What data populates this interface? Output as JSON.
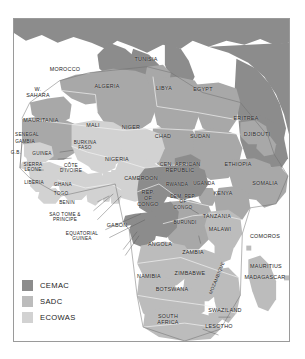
{
  "figure": {
    "type": "thematic-map",
    "region": "Africa",
    "title": "",
    "background_color": "#ffffff",
    "frame_color": "#9a9a9a"
  },
  "legend": {
    "position": "bottom-left",
    "items": [
      {
        "label": "CEMAC",
        "color": "#8c8c8c",
        "name": "cemac"
      },
      {
        "label": "SADC",
        "color": "#bcbcbc",
        "name": "sadc"
      },
      {
        "label": "ECOWAS",
        "color": "#d2d2d2",
        "name": "ecowas"
      }
    ]
  },
  "palette": {
    "cemac": "#8c8c8c",
    "sadc": "#bcbcbc",
    "ecowas": "#d2d2d2",
    "other_africa": "#a8a8a8",
    "outside": "#8c8c8c",
    "water": "#ffffff",
    "border_line": "#f2f2f2",
    "coast_line": "#6e6e6e",
    "leader_line": "#5a5a5a",
    "text": "#1b1b1b"
  },
  "map_labels": [
    {
      "text": "MOROCCO",
      "x": 64,
      "y": 68,
      "size": "n",
      "group": "other"
    },
    {
      "text": "W.\nSAHARA",
      "x": 37,
      "y": 91,
      "size": "n",
      "group": "other"
    },
    {
      "text": "ALGERIA",
      "x": 106,
      "y": 85,
      "size": "n",
      "group": "other"
    },
    {
      "text": "TUNISIA",
      "x": 145,
      "y": 58,
      "size": "n",
      "group": "other"
    },
    {
      "text": "LIBYA",
      "x": 163,
      "y": 87,
      "size": "n",
      "group": "other"
    },
    {
      "text": "EGYPT",
      "x": 202,
      "y": 88,
      "size": "n",
      "group": "other"
    },
    {
      "text": "MAURITANIA",
      "x": 40,
      "y": 119,
      "size": "n",
      "group": "other"
    },
    {
      "text": "MALI",
      "x": 92,
      "y": 124,
      "size": "n",
      "group": "ecowas"
    },
    {
      "text": "NIGER",
      "x": 130,
      "y": 126,
      "size": "n",
      "group": "ecowas"
    },
    {
      "text": "CHAD",
      "x": 162,
      "y": 135,
      "size": "n",
      "group": "other"
    },
    {
      "text": "SUDAN",
      "x": 199,
      "y": 135,
      "size": "n",
      "group": "other"
    },
    {
      "text": "ERITREA",
      "x": 245,
      "y": 117,
      "size": "n",
      "group": "other"
    },
    {
      "text": "DJIBOUTI",
      "x": 256,
      "y": 133,
      "size": "n",
      "group": "other"
    },
    {
      "text": "SENEGAL",
      "x": 26,
      "y": 134,
      "size": "sm",
      "group": "ecowas"
    },
    {
      "text": "GAMBIA",
      "x": 24,
      "y": 141,
      "size": "sm",
      "group": "ecowas"
    },
    {
      "text": "G.B.",
      "x": 15,
      "y": 152,
      "size": "sm",
      "group": "ecowas"
    },
    {
      "text": "GUINEA",
      "x": 41,
      "y": 153,
      "size": "sm",
      "group": "ecowas"
    },
    {
      "text": "SIERRA\nLEONE",
      "x": 32,
      "y": 166,
      "size": "sm",
      "group": "ecowas"
    },
    {
      "text": "LIBERIA",
      "x": 33,
      "y": 182,
      "size": "sm",
      "group": "ecowas"
    },
    {
      "text": "BURKINA\nFASO",
      "x": 84,
      "y": 144,
      "size": "sm",
      "group": "ecowas"
    },
    {
      "text": "CÔTE\nD'IVOIRE",
      "x": 70,
      "y": 167,
      "size": "sm",
      "group": "ecowas"
    },
    {
      "text": "GHANA",
      "x": 62,
      "y": 184,
      "size": "sm",
      "group": "ecowas"
    },
    {
      "text": "TOGO",
      "x": 60,
      "y": 193,
      "size": "sm",
      "group": "ecowas"
    },
    {
      "text": "BENIN",
      "x": 66,
      "y": 202,
      "size": "sm",
      "group": "ecowas"
    },
    {
      "text": "SAO TOME &\nPRINCIPE",
      "x": 64,
      "y": 216,
      "size": "sm",
      "group": "other"
    },
    {
      "text": "EQUATORIAL\nGUINEA",
      "x": 81,
      "y": 235,
      "size": "sm",
      "group": "cemac"
    },
    {
      "text": "NIGERIA",
      "x": 116,
      "y": 158,
      "size": "n",
      "group": "ecowas"
    },
    {
      "text": "CAMEROON",
      "x": 140,
      "y": 177,
      "size": "n",
      "group": "cemac"
    },
    {
      "text": "GABON",
      "x": 116,
      "y": 224,
      "size": "n",
      "group": "cemac"
    },
    {
      "text": "CEN. AFRICAN\nREPUBLIC",
      "x": 179,
      "y": 166,
      "size": "n",
      "group": "cemac"
    },
    {
      "text": "REP.\nOF\nCONGO",
      "x": 147,
      "y": 197,
      "size": "n",
      "group": "cemac"
    },
    {
      "text": "RWANDA",
      "x": 176,
      "y": 184,
      "size": "sm",
      "group": "other"
    },
    {
      "text": "UGANDA",
      "x": 203,
      "y": 183,
      "size": "sm",
      "group": "other"
    },
    {
      "text": "DEM. REP.\nOF\nCONGO",
      "x": 182,
      "y": 201,
      "size": "sm",
      "group": "other"
    },
    {
      "text": "BURUNDI",
      "x": 184,
      "y": 222,
      "size": "sm",
      "group": "other"
    },
    {
      "text": "KENYA",
      "x": 222,
      "y": 192,
      "size": "n",
      "group": "other"
    },
    {
      "text": "ETHIOPIA",
      "x": 237,
      "y": 163,
      "size": "n",
      "group": "other"
    },
    {
      "text": "SOMALIA",
      "x": 264,
      "y": 182,
      "size": "n",
      "group": "other"
    },
    {
      "text": "TANZANIA",
      "x": 216,
      "y": 215,
      "size": "n",
      "group": "sadc"
    },
    {
      "text": "MALAWI",
      "x": 219,
      "y": 228,
      "size": "n",
      "group": "sadc"
    },
    {
      "text": "COMOROS",
      "x": 264,
      "y": 235,
      "size": "n",
      "group": "sadc"
    },
    {
      "text": "ANGOLA",
      "x": 159,
      "y": 243,
      "size": "n",
      "group": "sadc"
    },
    {
      "text": "ZAMBIA",
      "x": 192,
      "y": 251,
      "size": "n",
      "group": "sadc"
    },
    {
      "text": "ZIMBABWE",
      "x": 189,
      "y": 272,
      "size": "n",
      "group": "sadc"
    },
    {
      "text": "NAMIBIA",
      "x": 148,
      "y": 275,
      "size": "n",
      "group": "sadc"
    },
    {
      "text": "BOTSWANA",
      "x": 171,
      "y": 288,
      "size": "n",
      "group": "sadc"
    },
    {
      "text": "MOZAMBIQUE",
      "x": 216,
      "y": 277,
      "size": "sm",
      "group": "sadc",
      "rotated": true
    },
    {
      "text": "MAURITIUS",
      "x": 265,
      "y": 265,
      "size": "n",
      "group": "sadc"
    },
    {
      "text": "MADAGASCAR",
      "x": 264,
      "y": 276,
      "size": "n",
      "group": "sadc"
    },
    {
      "text": "SOUTH\nAFRICA",
      "x": 167,
      "y": 318,
      "size": "n",
      "group": "sadc"
    },
    {
      "text": "SWAZILAND",
      "x": 224,
      "y": 309,
      "size": "n",
      "group": "sadc"
    },
    {
      "text": "LESOTHO",
      "x": 218,
      "y": 325,
      "size": "n",
      "group": "sadc"
    }
  ]
}
